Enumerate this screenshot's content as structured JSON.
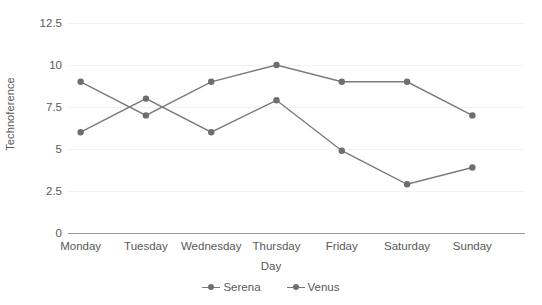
{
  "chart_data": {
    "type": "line",
    "title": "",
    "xlabel": "Day",
    "ylabel": "Technoference",
    "categories": [
      "Monday",
      "Tuesday",
      "Wednesday",
      "Thursday",
      "Friday",
      "Saturday",
      "Sunday"
    ],
    "series": [
      {
        "name": "Serena",
        "values": [
          9,
          7,
          9,
          10,
          9,
          9,
          7
        ]
      },
      {
        "name": "Venus",
        "values": [
          6,
          8,
          6,
          7.9,
          4.9,
          2.9,
          3.9
        ]
      }
    ],
    "yticks": [
      "0",
      "2.5",
      "5",
      "7.5",
      "10",
      "12.5"
    ],
    "ytick_values": [
      0,
      2.5,
      5,
      7.5,
      10,
      12.5
    ],
    "ylim": [
      0,
      12.5
    ],
    "grid": true,
    "legend_position": "bottom",
    "colors": {
      "series_line": "#7a7a7a",
      "series_marker": "#6e6e6e",
      "gridline": "#f2f2f2",
      "baseline": "#9a9a9a",
      "text": "#595959"
    }
  }
}
